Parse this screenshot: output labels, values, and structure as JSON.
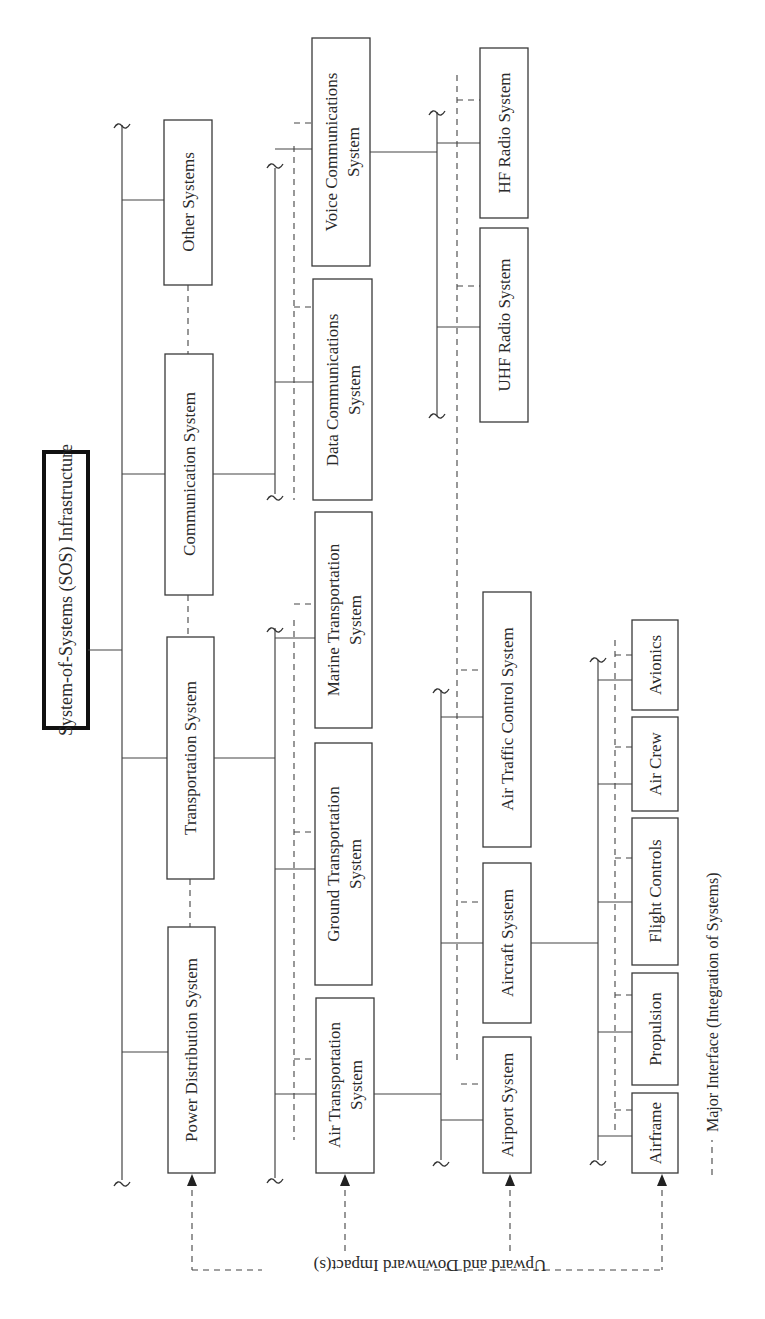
{
  "diagram": {
    "orientation": "rotated-90-ccw",
    "root": {
      "id": "sos",
      "label": "System-of-Systems (SOS) Infrastructure"
    },
    "levels": [
      {
        "level": 1,
        "nodes": [
          {
            "id": "power",
            "label": "Power Distribution System"
          },
          {
            "id": "transport",
            "label": "Transportation System"
          },
          {
            "id": "comm",
            "label": "Communication System"
          },
          {
            "id": "other",
            "label": "Other Systems"
          }
        ]
      },
      {
        "level": 2,
        "nodes": [
          {
            "id": "airtrans",
            "label": [
              "Air Transportation",
              "System"
            ],
            "parent": "transport"
          },
          {
            "id": "ground",
            "label": [
              "Ground Transportation",
              "System"
            ],
            "parent": "transport"
          },
          {
            "id": "marine",
            "label": [
              "Marine Transportation",
              "System"
            ],
            "parent": "transport"
          },
          {
            "id": "datacomm",
            "label": [
              "Data Communications",
              "System"
            ],
            "parent": "comm"
          },
          {
            "id": "voicecomm",
            "label": [
              "Voice Communications",
              "System"
            ],
            "parent": "comm"
          }
        ]
      },
      {
        "level": 3,
        "nodes": [
          {
            "id": "airport",
            "label": "Airport System",
            "parent": "airtrans"
          },
          {
            "id": "aircraft",
            "label": "Aircraft System",
            "parent": "airtrans"
          },
          {
            "id": "atc",
            "label": "Air Traffic Control System",
            "parent": "airtrans"
          },
          {
            "id": "uhf",
            "label": "UHF Radio System",
            "parent": "voicecomm"
          },
          {
            "id": "hf",
            "label": "HF Radio System",
            "parent": "voicecomm"
          }
        ]
      },
      {
        "level": 4,
        "nodes": [
          {
            "id": "airframe",
            "label": "Airframe",
            "parent": "aircraft"
          },
          {
            "id": "propulsion",
            "label": "Propulsion",
            "parent": "aircraft"
          },
          {
            "id": "flightctl",
            "label": "Flight Controls",
            "parent": "aircraft"
          },
          {
            "id": "aircrew",
            "label": "Air Crew",
            "parent": "aircraft"
          },
          {
            "id": "avionics",
            "label": "Avionics",
            "parent": "aircraft"
          }
        ]
      }
    ],
    "impact_label": "Upward and Downward Impact(s)",
    "legend": {
      "dashed_line_meaning": "Major Interface (Integration of Systems)",
      "dash_glyph": "- - - - -"
    },
    "colors": {
      "line": "#444444",
      "box_border": "#3a3a3a",
      "root_border": "#111111",
      "background": "#ffffff"
    }
  }
}
